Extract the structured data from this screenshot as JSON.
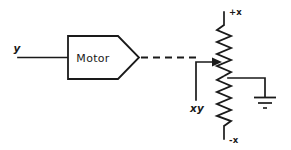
{
  "diagram": {
    "stroke_color": "#1a1a1a",
    "background_color": "#ffffff",
    "labels": {
      "input_signal": "y",
      "block_name": "Motor",
      "output_signal": "xy",
      "rail_positive": "+x",
      "rail_negative": "-x"
    },
    "components": [
      {
        "name": "input-wire",
        "kind": "wire",
        "signal": "y"
      },
      {
        "name": "motor-block",
        "kind": "pentagon-block",
        "label": "Motor"
      },
      {
        "name": "mechanical-linkage",
        "kind": "dashed-line"
      },
      {
        "name": "wiper-arrow",
        "kind": "arrow",
        "label": "xy"
      },
      {
        "name": "potentiometer",
        "kind": "resistor-zigzag",
        "top_terminal": "+x",
        "bottom_terminal": "-x"
      },
      {
        "name": "ground",
        "kind": "earth-ground"
      }
    ]
  }
}
